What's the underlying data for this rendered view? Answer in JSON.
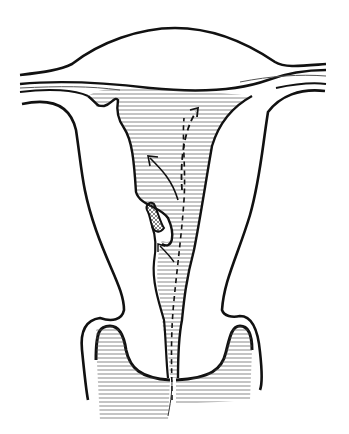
{
  "illustration": {
    "subject": "uterus cross-section line drawing",
    "style": "black ink line art with hatching",
    "background_color": "#ffffff",
    "stroke_color": "#111111",
    "labels": []
  }
}
